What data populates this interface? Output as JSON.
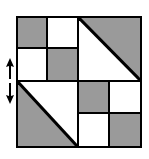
{
  "figure": {
    "name": "quilt-block-symmetry-diagram",
    "canvas": {
      "width": 149,
      "height": 159,
      "background": "#ffffff"
    },
    "colors": {
      "fill_gray": "#9a9a9a",
      "fill_white": "#ffffff",
      "line": "#000000"
    },
    "block": {
      "name": "four-patch-quilt-block",
      "x": 16,
      "y": 16,
      "width": 126,
      "height": 132,
      "border_color": "#000000",
      "border_width": 2,
      "quadrants": [
        {
          "position": "top-left",
          "type": "checkerboard",
          "cells": [
            {
              "position": "top-left",
              "fill": "gray"
            },
            {
              "position": "top-right",
              "fill": "white"
            },
            {
              "position": "bottom-left",
              "fill": "white"
            },
            {
              "position": "bottom-right",
              "fill": "gray"
            }
          ]
        },
        {
          "position": "top-right",
          "type": "half-square-triangle",
          "diagonal": "top-left-to-bottom-right",
          "upper_right_fill": "gray",
          "lower_left_fill": "white"
        },
        {
          "position": "bottom-left",
          "type": "half-square-triangle",
          "diagonal": "top-left-to-bottom-right",
          "upper_right_fill": "white",
          "lower_left_fill": "gray"
        },
        {
          "position": "bottom-right",
          "type": "checkerboard",
          "cells": [
            {
              "position": "top-left",
              "fill": "gray"
            },
            {
              "position": "top-right",
              "fill": "white"
            },
            {
              "position": "bottom-left",
              "fill": "white"
            },
            {
              "position": "bottom-right",
              "fill": "gray"
            }
          ]
        }
      ]
    },
    "annotation": {
      "name": "flip-axis-marker",
      "type": "double-headed-vertical-arrow",
      "icon": "double-arrow-vertical-icon",
      "x": 3,
      "y": 58,
      "width": 14,
      "height": 46,
      "color": "#000000",
      "meaning": "vertical flip / mirror axis"
    }
  }
}
